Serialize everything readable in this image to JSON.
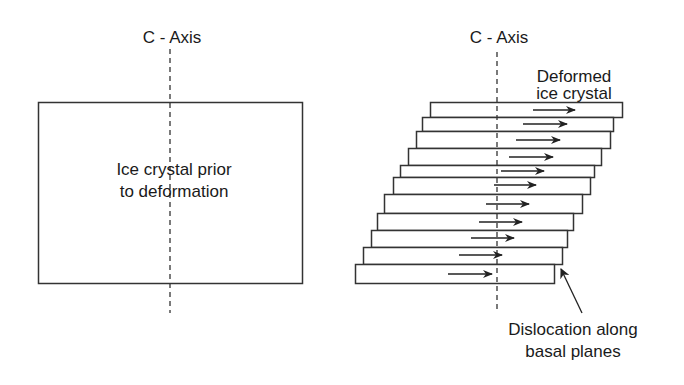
{
  "left_panel": {
    "axis_label": "C - Axis",
    "crystal_label_line1": "Ice crystal prior",
    "crystal_label_line2": "to deformation"
  },
  "right_panel": {
    "axis_label": "C - Axis",
    "crystal_label_line1": "Deformed",
    "crystal_label_line2": "ice crystal",
    "annotation_line1": "Dislocation along",
    "annotation_line2": "basal planes",
    "plate_count": 11,
    "arrow_direction": "right"
  },
  "colors": {
    "stroke": "#333333",
    "text": "#1a1a1a",
    "background": "#ffffff"
  }
}
